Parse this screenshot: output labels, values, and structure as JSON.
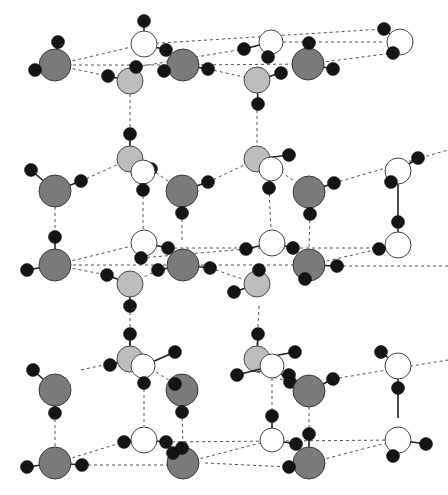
{
  "diagram": {
    "title": "",
    "colors": {
      "oxygen_dark": "#7a7a7a",
      "oxygen_light": "#bdbdbd",
      "oxygen_white": "#ffffff",
      "hydrogen": "#141414",
      "hbond": "#555555"
    },
    "molecules": [
      {
        "id": "L1a",
        "type": "dark",
        "o": [
          55,
          65,
          16
        ],
        "h": [
          [
            58,
            42
          ],
          [
            35,
            70
          ]
        ]
      },
      {
        "id": "L1b",
        "type": "white",
        "o": [
          144,
          44,
          13
        ],
        "h": [
          [
            144,
            21
          ],
          [
            166,
            50
          ]
        ]
      },
      {
        "id": "L1c",
        "type": "light",
        "o": [
          130,
          81,
          13
        ],
        "h": [
          [
            108,
            76
          ],
          [
            136,
            67
          ]
        ]
      },
      {
        "id": "L1d",
        "type": "dark",
        "o": [
          183,
          65,
          16
        ],
        "h": [
          [
            164,
            71
          ],
          [
            208,
            69
          ]
        ]
      },
      {
        "id": "L1e",
        "type": "white",
        "o": [
          271,
          42,
          12
        ],
        "h": [
          [
            244,
            49
          ],
          [
            268,
            57
          ]
        ]
      },
      {
        "id": "L1f",
        "type": "light",
        "o": [
          257,
          80,
          13
        ],
        "h": [
          [
            281,
            73
          ],
          [
            258,
            104
          ]
        ]
      },
      {
        "id": "L1g",
        "type": "dark",
        "o": [
          308,
          64,
          16
        ],
        "h": [
          [
            309,
            43
          ],
          [
            333,
            69
          ]
        ]
      },
      {
        "id": "L1h",
        "type": "white",
        "o": [
          400,
          42,
          13
        ],
        "h": [
          [
            384,
            29
          ],
          [
            393,
            53
          ]
        ]
      },
      {
        "id": "L2a",
        "type": "light",
        "o": [
          130,
          159,
          13
        ],
        "h": [
          [
            130,
            134
          ],
          [
            151,
            169
          ]
        ]
      },
      {
        "id": "L2b",
        "type": "white",
        "o": [
          143,
          172,
          12
        ],
        "h": [
          [
            143,
            190
          ]
        ]
      },
      {
        "id": "L2c",
        "type": "dark",
        "o": [
          55,
          191,
          16
        ],
        "h": [
          [
            31,
            170
          ],
          [
            81,
            181
          ]
        ]
      },
      {
        "id": "L2d",
        "type": "dark",
        "o": [
          182,
          191,
          16
        ],
        "h": [
          [
            208,
            182
          ],
          [
            182,
            213
          ]
        ]
      },
      {
        "id": "L2e",
        "type": "light",
        "o": [
          257,
          159,
          13
        ],
        "h": [
          [
            289,
            155
          ],
          [
            276,
            168
          ]
        ]
      },
      {
        "id": "L2f",
        "type": "white",
        "o": [
          271,
          169,
          12
        ],
        "h": [
          [
            269,
            188
          ]
        ]
      },
      {
        "id": "L2g",
        "type": "dark",
        "o": [
          309,
          192,
          16
        ],
        "h": [
          [
            334,
            183
          ],
          [
            310,
            214
          ]
        ]
      },
      {
        "id": "L2h",
        "type": "white",
        "o": [
          398,
          171,
          13
        ],
        "h": [
          [
            418,
            158
          ],
          [
            391,
            182
          ]
        ]
      },
      {
        "id": "L3a",
        "type": "dark",
        "o": [
          55,
          265,
          16
        ],
        "h": [
          [
            55,
            237
          ],
          [
            27,
            270
          ]
        ]
      },
      {
        "id": "L3b",
        "type": "white",
        "o": [
          144,
          243,
          13
        ],
        "h": [
          [
            141,
            258
          ],
          [
            168,
            248
          ]
        ]
      },
      {
        "id": "L3c",
        "type": "light",
        "o": [
          130,
          284,
          13
        ],
        "h": [
          [
            107,
            275
          ],
          [
            130,
            306
          ]
        ]
      },
      {
        "id": "L3d",
        "type": "dark",
        "o": [
          183,
          265,
          16
        ],
        "h": [
          [
            158,
            270
          ],
          [
            210,
            268
          ]
        ]
      },
      {
        "id": "L3e",
        "type": "white",
        "o": [
          272,
          243,
          13
        ],
        "h": [
          [
            246,
            249
          ],
          [
            293,
            248
          ]
        ]
      },
      {
        "id": "L3f",
        "type": "light",
        "o": [
          257,
          284,
          13
        ],
        "h": [
          [
            259,
            270
          ],
          [
            234,
            292
          ]
        ]
      },
      {
        "id": "L3g",
        "type": "dark",
        "o": [
          309,
          265,
          16
        ],
        "h": [
          [
            305,
            279
          ],
          [
            337,
            266
          ]
        ]
      },
      {
        "id": "L3h",
        "type": "white",
        "o": [
          398,
          245,
          13
        ],
        "h": [
          [
            398,
            222
          ],
          [
            379,
            249
          ]
        ]
      },
      {
        "id": "L4a",
        "type": "light",
        "o": [
          130,
          359,
          13
        ],
        "h": [
          [
            130,
            334
          ],
          [
            110,
            365
          ]
        ]
      },
      {
        "id": "L4b",
        "type": "white",
        "o": [
          143,
          366,
          12
        ],
        "h": [
          [
            144,
            383
          ],
          [
            175,
            352
          ]
        ]
      },
      {
        "id": "L4c",
        "type": "dark",
        "o": [
          55,
          390,
          16
        ],
        "h": [
          [
            33,
            370
          ],
          [
            55,
            413
          ]
        ]
      },
      {
        "id": "L4d",
        "type": "dark",
        "o": [
          182,
          390,
          16
        ],
        "h": [
          [
            175,
            384
          ],
          [
            182,
            412
          ]
        ]
      },
      {
        "id": "L4e",
        "type": "light",
        "o": [
          257,
          359,
          13
        ],
        "h": [
          [
            258,
            334
          ],
          [
            295,
            352
          ]
        ]
      },
      {
        "id": "L4f",
        "type": "white",
        "o": [
          272,
          366,
          12
        ],
        "h": [
          [
            237,
            375
          ],
          [
            290,
            382
          ]
        ]
      },
      {
        "id": "L4g",
        "type": "dark",
        "o": [
          309,
          391,
          16
        ],
        "h": [
          [
            289,
            375
          ],
          [
            333,
            379
          ]
        ]
      },
      {
        "id": "L4h",
        "type": "white",
        "o": [
          398,
          366,
          13
        ],
        "h": [
          [
            381,
            352
          ],
          [
            398,
            388
          ]
        ]
      },
      {
        "id": "L5a",
        "type": "white",
        "o": [
          144,
          440,
          13
        ],
        "h": [
          [
            124,
            442
          ],
          [
            166,
            442
          ]
        ]
      },
      {
        "id": "L5b",
        "type": "dark",
        "o": [
          55,
          463,
          16
        ],
        "h": [
          [
            27,
            467
          ],
          [
            82,
            465
          ]
        ]
      },
      {
        "id": "L5c",
        "type": "dark",
        "o": [
          183,
          463,
          16
        ],
        "h": [
          [
            173,
            453
          ],
          [
            182,
            448
          ]
        ]
      },
      {
        "id": "L5d",
        "type": "white",
        "o": [
          272,
          440,
          12
        ],
        "h": [
          [
            272,
            416
          ],
          [
            296,
            444
          ]
        ]
      },
      {
        "id": "L5e",
        "type": "dark",
        "o": [
          309,
          463,
          16
        ],
        "h": [
          [
            289,
            467
          ],
          [
            309,
            434
          ]
        ]
      },
      {
        "id": "L5f",
        "type": "white",
        "o": [
          398,
          440,
          13
        ],
        "h": [
          [
            393,
            456
          ],
          [
            426,
            444
          ]
        ]
      }
    ],
    "covalent_long": [
      [
        [
          398,
          182
        ],
        [
          398,
          222
        ]
      ],
      [
        [
          398,
          388
        ],
        [
          398,
          418
        ]
      ]
    ],
    "hbonds": [
      [
        [
          55,
          65
        ],
        [
          144,
          44
        ]
      ],
      [
        [
          55,
          65
        ],
        [
          183,
          65
        ]
      ],
      [
        [
          55,
          65
        ],
        [
          108,
          76
        ]
      ],
      [
        [
          144,
          44
        ],
        [
          384,
          29
        ]
      ],
      [
        [
          166,
          50
        ],
        [
          183,
          65
        ]
      ],
      [
        [
          183,
          65
        ],
        [
          308,
          64
        ]
      ],
      [
        [
          136,
          67
        ],
        [
          244,
          49
        ]
      ],
      [
        [
          208,
          69
        ],
        [
          257,
          80
        ]
      ],
      [
        [
          271,
          42
        ],
        [
          384,
          42
        ]
      ],
      [
        [
          308,
          64
        ],
        [
          393,
          53
        ]
      ],
      [
        [
          130,
          94
        ],
        [
          130,
          134
        ]
      ],
      [
        [
          257,
          104
        ],
        [
          257,
          146
        ]
      ],
      [
        [
          81,
          181
        ],
        [
          130,
          159
        ]
      ],
      [
        [
          151,
          169
        ],
        [
          182,
          191
        ]
      ],
      [
        [
          143,
          190
        ],
        [
          143,
          230
        ]
      ],
      [
        [
          182,
          213
        ],
        [
          182,
          243
        ]
      ],
      [
        [
          55,
          207
        ],
        [
          55,
          237
        ]
      ],
      [
        [
          208,
          182
        ],
        [
          257,
          159
        ]
      ],
      [
        [
          276,
          168
        ],
        [
          309,
          192
        ]
      ],
      [
        [
          269,
          188
        ],
        [
          271,
          230
        ]
      ],
      [
        [
          310,
          214
        ],
        [
          309,
          249
        ]
      ],
      [
        [
          334,
          183
        ],
        [
          448,
          150
        ]
      ],
      [
        [
          55,
          265
        ],
        [
          144,
          243
        ]
      ],
      [
        [
          55,
          265
        ],
        [
          183,
          265
        ]
      ],
      [
        [
          55,
          265
        ],
        [
          107,
          275
        ]
      ],
      [
        [
          168,
          248
        ],
        [
          398,
          248
        ]
      ],
      [
        [
          158,
          270
        ],
        [
          130,
          284
        ]
      ],
      [
        [
          183,
          265
        ],
        [
          309,
          265
        ]
      ],
      [
        [
          141,
          258
        ],
        [
          246,
          249
        ]
      ],
      [
        [
          210,
          268
        ],
        [
          257,
          284
        ]
      ],
      [
        [
          309,
          265
        ],
        [
          379,
          249
        ]
      ],
      [
        [
          337,
          266
        ],
        [
          448,
          266
        ]
      ],
      [
        [
          130,
          306
        ],
        [
          130,
          346
        ]
      ],
      [
        [
          259,
          306
        ],
        [
          257,
          346
        ]
      ],
      [
        [
          55,
          374
        ],
        [
          55,
          374
        ]
      ],
      [
        [
          81,
          370
        ],
        [
          130,
          359
        ]
      ],
      [
        [
          151,
          369
        ],
        [
          175,
          384
        ]
      ],
      [
        [
          144,
          383
        ],
        [
          144,
          426
        ]
      ],
      [
        [
          182,
          412
        ],
        [
          183,
          447
        ]
      ],
      [
        [
          55,
          413
        ],
        [
          55,
          447
        ]
      ],
      [
        [
          257,
          372
        ],
        [
          290,
          382
        ]
      ],
      [
        [
          272,
          378
        ],
        [
          272,
          416
        ]
      ],
      [
        [
          309,
          407
        ],
        [
          309,
          434
        ]
      ],
      [
        [
          333,
          379
        ],
        [
          448,
          360
        ]
      ],
      [
        [
          55,
          463
        ],
        [
          124,
          442
        ]
      ],
      [
        [
          82,
          465
        ],
        [
          183,
          465
        ]
      ],
      [
        [
          166,
          442
        ],
        [
          398,
          440
        ]
      ],
      [
        [
          183,
          463
        ],
        [
          272,
          440
        ]
      ],
      [
        [
          205,
          463
        ],
        [
          289,
          467
        ]
      ],
      [
        [
          309,
          463
        ],
        [
          398,
          440
        ]
      ]
    ]
  }
}
